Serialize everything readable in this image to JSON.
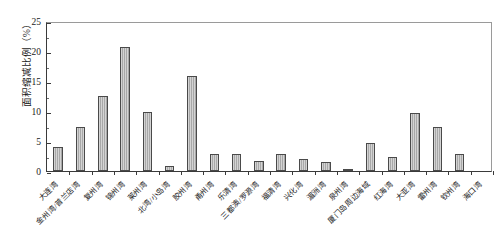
{
  "chart_data": {
    "type": "bar",
    "title": "",
    "xlabel": "",
    "ylabel": "面积缩减比例（%）",
    "ylim": [
      0,
      25
    ],
    "yticks": [
      0,
      5,
      10,
      15,
      20,
      25
    ],
    "grid": false,
    "legend": null,
    "bar_color": "#a8a8a8",
    "bar_edge_color": "#4a4a4a",
    "categories": [
      "大连湾",
      "金州湾/普兰店湾",
      "复州湾",
      "锦州湾",
      "莱州湾",
      "北湾/小岛湾",
      "胶州湾",
      "甬州湾",
      "乐清湾",
      "三都澳/罗源湾",
      "福清湾",
      "兴化湾",
      "湄洲湾",
      "泉州湾",
      "厦门岛周边海域",
      "红海湾",
      "大亚湾",
      "雷州湾",
      "钦州湾",
      "海口湾"
    ],
    "values": [
      4.0,
      7.4,
      12.5,
      20.6,
      9.9,
      0.8,
      15.8,
      2.8,
      2.8,
      1.6,
      2.9,
      2.0,
      1.5,
      0.3,
      4.6,
      2.4,
      9.6,
      7.3,
      2.9,
      0.0
    ]
  }
}
